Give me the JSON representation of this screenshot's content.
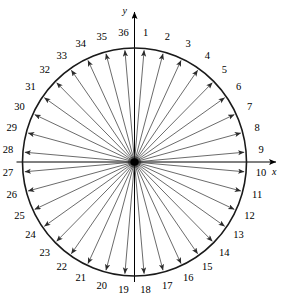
{
  "figure": {
    "axes": {
      "y_label": "y",
      "x_label": "x",
      "y_axis_name": "vertical-axis",
      "x_axis_name": "horizontal-axis"
    },
    "geometry": {
      "center_x": 134.5,
      "center_y": 162,
      "radius_x": 112,
      "radius_y": 114,
      "label_radius_x": 127,
      "label_radius_y": 129,
      "spoke_count": 36,
      "angle_step_deg": 10,
      "start_angle_deg": 85,
      "direction": "clockwise"
    },
    "colors": {
      "background": "#ffffff",
      "circle_stroke": "#1a1a1a",
      "ray_stroke": "#3a3a3a",
      "axis_stroke": "#000000",
      "text": "#000000"
    },
    "spokes": [
      {
        "n": "1",
        "angle_deg": 85
      },
      {
        "n": "2",
        "angle_deg": 75
      },
      {
        "n": "3",
        "angle_deg": 65
      },
      {
        "n": "4",
        "angle_deg": 55
      },
      {
        "n": "5",
        "angle_deg": 45
      },
      {
        "n": "6",
        "angle_deg": 35
      },
      {
        "n": "7",
        "angle_deg": 25
      },
      {
        "n": "8",
        "angle_deg": 15
      },
      {
        "n": "9",
        "angle_deg": 5
      },
      {
        "n": "10",
        "angle_deg": -5
      },
      {
        "n": "11",
        "angle_deg": -15
      },
      {
        "n": "12",
        "angle_deg": -25
      },
      {
        "n": "13",
        "angle_deg": -35
      },
      {
        "n": "14",
        "angle_deg": -45
      },
      {
        "n": "15",
        "angle_deg": -55
      },
      {
        "n": "16",
        "angle_deg": -65
      },
      {
        "n": "17",
        "angle_deg": -75
      },
      {
        "n": "18",
        "angle_deg": -85
      },
      {
        "n": "19",
        "angle_deg": -95
      },
      {
        "n": "20",
        "angle_deg": -105
      },
      {
        "n": "21",
        "angle_deg": -115
      },
      {
        "n": "22",
        "angle_deg": -125
      },
      {
        "n": "23",
        "angle_deg": -135
      },
      {
        "n": "24",
        "angle_deg": -145
      },
      {
        "n": "25",
        "angle_deg": -155
      },
      {
        "n": "26",
        "angle_deg": -165
      },
      {
        "n": "27",
        "angle_deg": -175
      },
      {
        "n": "28",
        "angle_deg": 175
      },
      {
        "n": "29",
        "angle_deg": 165
      },
      {
        "n": "30",
        "angle_deg": 155
      },
      {
        "n": "31",
        "angle_deg": 145
      },
      {
        "n": "32",
        "angle_deg": 135
      },
      {
        "n": "33",
        "angle_deg": 125
      },
      {
        "n": "34",
        "angle_deg": 115
      },
      {
        "n": "35",
        "angle_deg": 105
      },
      {
        "n": "36",
        "angle_deg": 95
      }
    ]
  }
}
